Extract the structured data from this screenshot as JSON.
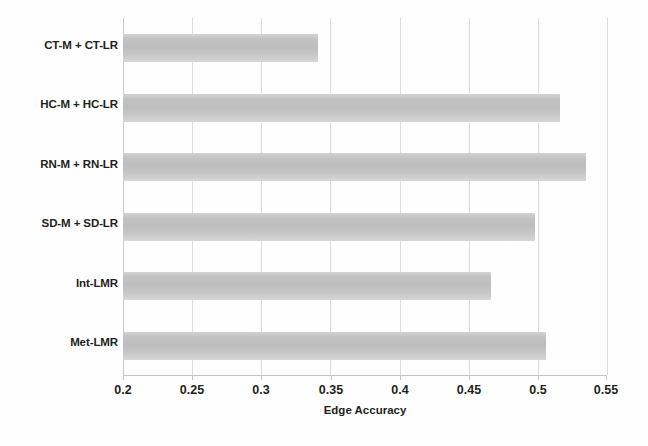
{
  "chart_data": {
    "type": "bar",
    "orientation": "horizontal",
    "title": "",
    "xlabel": "Edge Accuracy",
    "ylabel": "",
    "categories": [
      "CT-M + CT-LR",
      "HC-M + HC-LR",
      "RN-M + RN-LR",
      "SD-M + SD-LR",
      "Int-LMR",
      "Met-LMR"
    ],
    "values": [
      0.341,
      0.516,
      0.535,
      0.498,
      0.466,
      0.506
    ],
    "xlim": [
      0.2,
      0.55
    ],
    "xticks": [
      0.2,
      0.25,
      0.3,
      0.35,
      0.4,
      0.45,
      0.5,
      0.55
    ],
    "xtick_labels": [
      "0.2",
      "0.25",
      "0.3",
      "0.35",
      "0.4",
      "0.45",
      "0.5",
      "0.55"
    ],
    "grid": "vertical",
    "legend": "none",
    "bar_color": "#c2c2c2",
    "background_color": "#ffffff",
    "grid_color": "#dcdcdc",
    "text_color": "#231f20"
  }
}
